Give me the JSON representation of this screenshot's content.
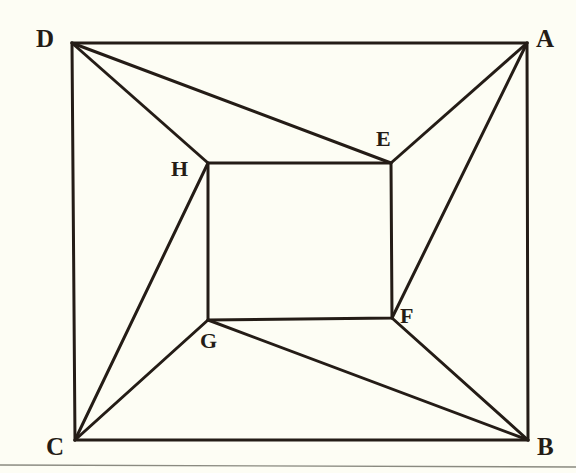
{
  "figure": {
    "background_color": "#fdfdf4",
    "stroke_color": "#241c16",
    "rule_color": "#8a8a80",
    "stroke_width": 3,
    "canvas": {
      "width": 576,
      "height": 473
    },
    "outer_quad": {
      "name": "ABCD",
      "points": [
        {
          "label": "A",
          "x": 527,
          "y": 43
        },
        {
          "label": "B",
          "x": 528,
          "y": 440
        },
        {
          "label": "C",
          "x": 75,
          "y": 440
        },
        {
          "label": "D",
          "x": 72,
          "y": 43
        }
      ]
    },
    "inner_quad": {
      "name": "EFGH",
      "points": [
        {
          "label": "E",
          "x": 391,
          "y": 163
        },
        {
          "label": "F",
          "x": 392,
          "y": 318
        },
        {
          "label": "G",
          "x": 208,
          "y": 320
        },
        {
          "label": "H",
          "x": 208,
          "y": 163
        }
      ]
    },
    "connectors": [
      {
        "from": "D",
        "to": "E",
        "x1": 72,
        "y1": 43,
        "x2": 391,
        "y2": 163
      },
      {
        "from": "D",
        "to": "H",
        "x1": 72,
        "y1": 43,
        "x2": 208,
        "y2": 163
      },
      {
        "from": "A",
        "to": "E",
        "x1": 527,
        "y1": 43,
        "x2": 391,
        "y2": 163
      },
      {
        "from": "A",
        "to": "F",
        "x1": 527,
        "y1": 43,
        "x2": 392,
        "y2": 318
      },
      {
        "from": "C",
        "to": "H",
        "x1": 75,
        "y1": 440,
        "x2": 208,
        "y2": 163
      },
      {
        "from": "C",
        "to": "G",
        "x1": 75,
        "y1": 440,
        "x2": 208,
        "y2": 320
      },
      {
        "from": "B",
        "to": "G",
        "x1": 528,
        "y1": 440,
        "x2": 208,
        "y2": 320
      },
      {
        "from": "B",
        "to": "F",
        "x1": 528,
        "y1": 440,
        "x2": 392,
        "y2": 318
      }
    ],
    "bottom_rule": {
      "x1": 0,
      "y1": 465,
      "x2": 576,
      "y2": 467
    },
    "labels": [
      {
        "key": "A",
        "text": "A",
        "x": 536,
        "y": 26,
        "group": "outer"
      },
      {
        "key": "B",
        "text": "B",
        "x": 537,
        "y": 434,
        "group": "outer"
      },
      {
        "key": "C",
        "text": "C",
        "x": 46,
        "y": 434,
        "group": "outer"
      },
      {
        "key": "D",
        "text": "D",
        "x": 36,
        "y": 26,
        "group": "outer"
      },
      {
        "key": "E",
        "text": "E",
        "x": 376,
        "y": 128,
        "group": "inner"
      },
      {
        "key": "F",
        "text": "F",
        "x": 400,
        "y": 305,
        "group": "inner"
      },
      {
        "key": "G",
        "text": "G",
        "x": 200,
        "y": 330,
        "group": "inner"
      },
      {
        "key": "H",
        "text": "H",
        "x": 171,
        "y": 158,
        "group": "inner"
      }
    ]
  }
}
